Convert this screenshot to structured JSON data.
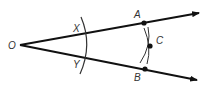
{
  "diagram": {
    "labels": {
      "O": "O",
      "X": "X",
      "Y": "Y",
      "A": "A",
      "B": "B",
      "C": "C"
    },
    "colors": {
      "stroke": "#111111",
      "label": "#333333"
    }
  }
}
